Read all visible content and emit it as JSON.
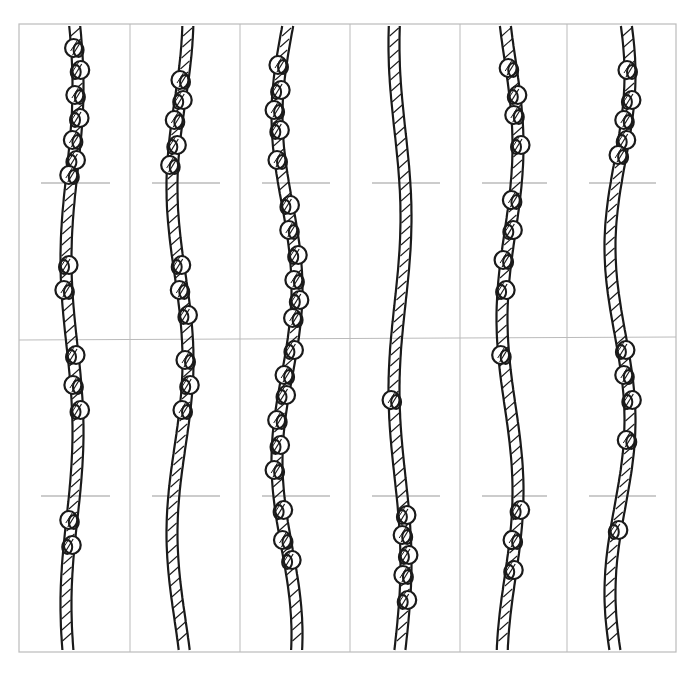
{
  "figure": {
    "frame": {
      "x1": 19,
      "y1": 24,
      "x2": 676,
      "y2": 652,
      "color": "#bbbbbb"
    },
    "divider_y": 340,
    "tick_lines_y": [
      183,
      496
    ],
    "rope_color": "#1a1a1a",
    "columns": [
      {
        "x1": 19,
        "x2": 130
      },
      {
        "x1": 130,
        "x2": 240
      },
      {
        "x1": 240,
        "x2": 350
      },
      {
        "x1": 350,
        "x2": 460
      },
      {
        "x1": 460,
        "x2": 567
      },
      {
        "x1": 567,
        "x2": 676
      }
    ],
    "ropes": [
      {
        "id": 1,
        "cx": 72,
        "knots": [
          48,
          70,
          95,
          118,
          140,
          160,
          175,
          265,
          290,
          355,
          385,
          410,
          520,
          545
        ]
      },
      {
        "id": 2,
        "cx": 180,
        "knots": [
          80,
          100,
          120,
          145,
          165,
          265,
          290,
          315,
          360,
          385,
          410
        ]
      },
      {
        "id": 3,
        "cx": 287,
        "knots": [
          65,
          90,
          110,
          130,
          160,
          205,
          230,
          255,
          280,
          300,
          318,
          350,
          375,
          395,
          420,
          445,
          470,
          510,
          540,
          560
        ]
      },
      {
        "id": 4,
        "cx": 400,
        "knots": [
          400,
          515,
          535,
          555,
          575,
          600
        ]
      },
      {
        "id": 5,
        "cx": 510,
        "knots": [
          68,
          95,
          115,
          145,
          200,
          230,
          260,
          290,
          355,
          510,
          540,
          570
        ]
      },
      {
        "id": 6,
        "cx": 620,
        "knots": [
          70,
          100,
          120,
          140,
          155,
          350,
          375,
          400,
          440,
          530
        ]
      }
    ]
  }
}
